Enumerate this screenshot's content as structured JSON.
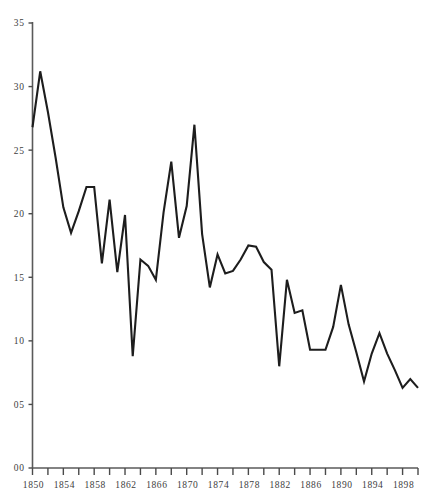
{
  "chart_data": {
    "type": "line",
    "title": "",
    "subtitle": "",
    "xlabel": "",
    "ylabel": "",
    "xlim": [
      1850,
      1900
    ],
    "ylim": [
      0,
      35
    ],
    "grid": false,
    "legend": null,
    "y_ticks": [
      0,
      5,
      10,
      15,
      20,
      25,
      30,
      35
    ],
    "y_tick_labels": [
      "00",
      "05",
      "10",
      "15",
      "20",
      "25",
      "30",
      "35"
    ],
    "x_ticks": [
      1850,
      1852,
      1854,
      1856,
      1858,
      1860,
      1862,
      1864,
      1866,
      1868,
      1870,
      1872,
      1874,
      1876,
      1878,
      1880,
      1882,
      1884,
      1886,
      1888,
      1890,
      1892,
      1894,
      1896,
      1898,
      1900
    ],
    "x_tick_labels": [
      "1850",
      "",
      "1854",
      "",
      "1858",
      "",
      "1862",
      "",
      "1866",
      "",
      "1870",
      "",
      "1874",
      "",
      "1878",
      "",
      "1882",
      "",
      "1886",
      "",
      "1890",
      "",
      "1894",
      "",
      "1898",
      ""
    ],
    "x": [
      1850,
      1851,
      1852,
      1853,
      1854,
      1855,
      1856,
      1857,
      1858,
      1859,
      1860,
      1861,
      1862,
      1863,
      1864,
      1865,
      1866,
      1867,
      1868,
      1869,
      1870,
      1871,
      1872,
      1873,
      1874,
      1875,
      1876,
      1877,
      1878,
      1879,
      1880,
      1881,
      1882,
      1883,
      1884,
      1885,
      1886,
      1887,
      1888,
      1889,
      1890,
      1891,
      1892,
      1893,
      1894,
      1895,
      1896,
      1897,
      1898,
      1899,
      1900
    ],
    "values": [
      26.8,
      31.2,
      28.0,
      24.4,
      20.5,
      18.5,
      20.2,
      22.1,
      22.1,
      16.1,
      21.1,
      15.4,
      19.9,
      8.8,
      16.4,
      15.9,
      14.8,
      20.1,
      24.1,
      18.1,
      20.6,
      27.0,
      18.4,
      14.2,
      16.8,
      15.3,
      15.5,
      16.4,
      17.5,
      17.4,
      16.2,
      15.6,
      8.0,
      14.8,
      12.2,
      12.4,
      9.3,
      9.3,
      9.3,
      11.1,
      14.4,
      11.3,
      9.1,
      6.8,
      9.0,
      10.6,
      9.0,
      7.7,
      6.3,
      7.0,
      6.3
    ],
    "series_color": "#1d1d1d",
    "axis_color": "#5a5a5a"
  }
}
